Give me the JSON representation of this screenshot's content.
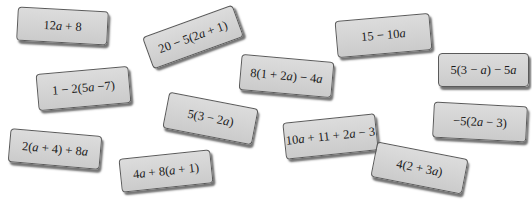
{
  "cards": [
    {
      "label": "12a + 8"
    },
    {
      "label": "20 − 5(2a + 1)"
    },
    {
      "label": "15 − 10a"
    },
    {
      "label": "1 − 2(5a −7)"
    },
    {
      "label": "8(1 + 2a) − 4a"
    },
    {
      "label": "5(3 − a) − 5a"
    },
    {
      "label": "5(3 − 2a)"
    },
    {
      "label": "2(a + 4) + 8a"
    },
    {
      "label": "4a + 8(a + 1)"
    },
    {
      "label": "10a + 11 + 2a − 3"
    },
    {
      "label": "−5(2a − 3)"
    },
    {
      "label": "4(2 + 3a)"
    }
  ],
  "colors": {
    "card_fill": "#d4d4d4",
    "card_border": "#5a5a5a",
    "background": "#ffffff"
  }
}
